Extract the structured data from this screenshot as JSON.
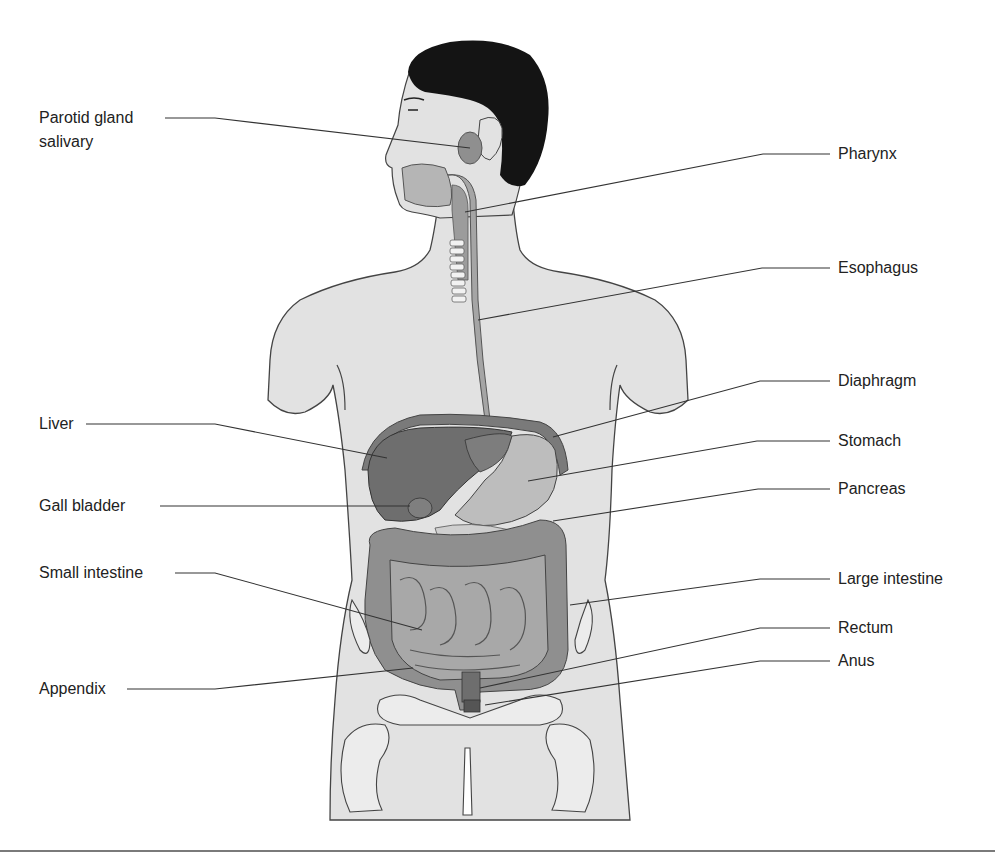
{
  "diagram": {
    "colors": {
      "body_fill": "#e2e2e2",
      "outline": "#444444",
      "hair": "#141414",
      "organ_dark": "#6e6e6e",
      "organ_mid": "#8f8f8f",
      "organ_light": "#bdbdbd",
      "leader_line": "#333333",
      "bottom_rule": "#7a7a7a"
    },
    "labels_left": [
      {
        "id": "parotid",
        "text": "Parotid gland",
        "text2": "salivary"
      },
      {
        "id": "liver",
        "text": "Liver"
      },
      {
        "id": "gall-bladder",
        "text": "Gall bladder"
      },
      {
        "id": "small-intestine",
        "text": "Small intestine"
      },
      {
        "id": "appendix",
        "text": "Appendix"
      }
    ],
    "labels_right": [
      {
        "id": "pharynx",
        "text": "Pharynx"
      },
      {
        "id": "esophagus",
        "text": "Esophagus"
      },
      {
        "id": "diaphragm",
        "text": "Diaphragm"
      },
      {
        "id": "stomach",
        "text": "Stomach"
      },
      {
        "id": "pancreas",
        "text": "Pancreas"
      },
      {
        "id": "large-intestine",
        "text": "Large intestine"
      },
      {
        "id": "rectum",
        "text": "Rectum"
      },
      {
        "id": "anus",
        "text": "Anus"
      }
    ]
  }
}
